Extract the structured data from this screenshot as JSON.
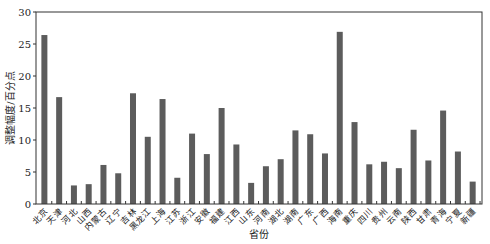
{
  "chart_data": {
    "type": "bar",
    "title": "",
    "xlabel": "省份",
    "ylabel": "调整幅度/百分点",
    "ylim": [
      0,
      30
    ],
    "yticks": [
      0,
      5,
      10,
      15,
      20,
      25,
      30
    ],
    "grid": false,
    "legend": null,
    "bar_color": "#5c5c5c",
    "categories": [
      "北京",
      "天津",
      "河北",
      "山西",
      "内蒙古",
      "辽宁",
      "吉林",
      "黑龙江",
      "上海",
      "江苏",
      "浙江",
      "安徽",
      "福建",
      "江西",
      "山东",
      "河南",
      "湖北",
      "湖南",
      "广东",
      "广西",
      "海南",
      "重庆",
      "四川",
      "贵州",
      "云南",
      "陕西",
      "甘肃",
      "青海",
      "宁夏",
      "新疆"
    ],
    "values": [
      26.4,
      16.7,
      2.9,
      3.1,
      6.1,
      4.8,
      17.3,
      10.5,
      16.4,
      4.1,
      11.0,
      7.8,
      15.0,
      9.3,
      3.3,
      5.9,
      7.0,
      11.5,
      10.9,
      7.9,
      26.9,
      12.8,
      6.2,
      6.6,
      5.6,
      11.6,
      6.8,
      14.6,
      8.2,
      3.5
    ]
  }
}
